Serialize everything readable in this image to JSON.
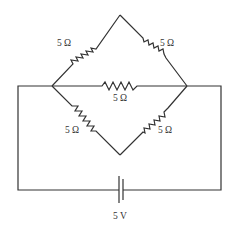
{
  "diagram": {
    "type": "circuit",
    "resistors": [
      {
        "id": "R_top_left",
        "label": "5 Ω"
      },
      {
        "id": "R_top_right",
        "label": "5 Ω"
      },
      {
        "id": "R_middle",
        "label": "5 Ω"
      },
      {
        "id": "R_bottom_left",
        "label": "5 Ω"
      },
      {
        "id": "R_bottom_right",
        "label": "5 Ω"
      }
    ],
    "battery": {
      "label": "5 V"
    },
    "colors": {
      "line": "#333333",
      "background": "#ffffff"
    }
  }
}
